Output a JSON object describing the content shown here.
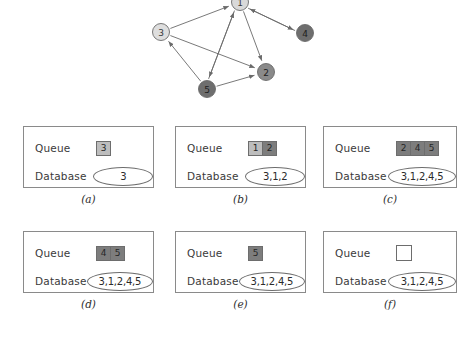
{
  "figure": {
    "graph": {
      "name": "directed-graph",
      "nodes": [
        {
          "id": "1",
          "label": "1",
          "cx": 240,
          "cy": 2,
          "r": 8.5,
          "fill": "#d9d9d9",
          "text_class": ""
        },
        {
          "id": "3",
          "label": "3",
          "cx": 161,
          "cy": 32,
          "r": 8.5,
          "fill": "#dedede",
          "text_class": ""
        },
        {
          "id": "4",
          "label": "4",
          "cx": 305,
          "cy": 33,
          "r": 8.5,
          "fill": "#6e6e6e",
          "text_class": "on-dark"
        },
        {
          "id": "2",
          "label": "2",
          "cx": 266,
          "cy": 72,
          "r": 8.5,
          "fill": "#8a8a8a",
          "text_class": "on-dark"
        },
        {
          "id": "5",
          "label": "5",
          "cx": 207,
          "cy": 89,
          "r": 8.5,
          "fill": "#6e6e6e",
          "text_class": "on-dark"
        }
      ],
      "edges": [
        {
          "from": "3",
          "to": "1",
          "name": "edge-3-1"
        },
        {
          "from": "1",
          "to": "4",
          "name": "edge-1-4"
        },
        {
          "from": "4",
          "to": "1",
          "name": "edge-4-1"
        },
        {
          "from": "1",
          "to": "2",
          "name": "edge-1-2"
        },
        {
          "from": "1",
          "to": "5",
          "name": "edge-1-5"
        },
        {
          "from": "5",
          "to": "1",
          "name": "edge-5-1"
        },
        {
          "from": "3",
          "to": "2",
          "name": "edge-3-2"
        },
        {
          "from": "5",
          "to": "3",
          "name": "edge-5-3"
        },
        {
          "from": "5",
          "to": "2",
          "name": "edge-5-2"
        }
      ],
      "edge_color": "#6a6a6a"
    },
    "row_labels": {
      "queue": "Queue",
      "database": "Database"
    },
    "panels": [
      {
        "key": "a",
        "caption": "(a)",
        "queue_label": "Queue",
        "database_label": "Database",
        "queue": [
          {
            "value": "3",
            "shade": "light"
          }
        ],
        "database": "3",
        "db_width": 62
      },
      {
        "key": "b",
        "caption": "(b)",
        "queue_label": "Queue",
        "database_label": "Database",
        "queue": [
          {
            "value": "1",
            "shade": "light"
          },
          {
            "value": "2",
            "shade": "dark"
          }
        ],
        "database": "3,1,2",
        "db_width": 62
      },
      {
        "key": "c",
        "caption": "(c)",
        "queue_label": "Queue",
        "database_label": "Database",
        "queue": [
          {
            "value": "2",
            "shade": "dark"
          },
          {
            "value": "4",
            "shade": "dark"
          },
          {
            "value": "5",
            "shade": "dark"
          }
        ],
        "database": "3,1,2,4,5",
        "db_width": 78
      },
      {
        "key": "d",
        "caption": "(d)",
        "queue_label": "Queue",
        "database_label": "Database",
        "queue": [
          {
            "value": "4",
            "shade": "dark"
          },
          {
            "value": "5",
            "shade": "dark"
          }
        ],
        "database": "3,1,2,4,5",
        "db_width": 78
      },
      {
        "key": "e",
        "caption": "(e)",
        "queue_label": "Queue",
        "database_label": "Database",
        "queue": [
          {
            "value": "5",
            "shade": "dark"
          }
        ],
        "database": "3,1,2,4,5",
        "db_width": 78
      },
      {
        "key": "f",
        "caption": "(f)",
        "queue_label": "Queue",
        "database_label": "Database",
        "queue": [
          {
            "value": "",
            "shade": "empty"
          }
        ],
        "database": "3,1,2,4,5",
        "db_width": 78
      }
    ],
    "layout": {
      "panel_positions": [
        {
          "left": 23,
          "top": 126,
          "width": 131,
          "height": 62,
          "caption_top": 193
        },
        {
          "left": 175,
          "top": 126,
          "width": 131,
          "height": 62,
          "caption_top": 193
        },
        {
          "left": 323,
          "top": 126,
          "width": 134,
          "height": 62,
          "caption_top": 193
        },
        {
          "left": 23,
          "top": 231,
          "width": 131,
          "height": 62,
          "caption_top": 298
        },
        {
          "left": 175,
          "top": 231,
          "width": 131,
          "height": 62,
          "caption_top": 298
        },
        {
          "left": 323,
          "top": 231,
          "width": 134,
          "height": 62,
          "caption_top": 298
        }
      ]
    }
  }
}
